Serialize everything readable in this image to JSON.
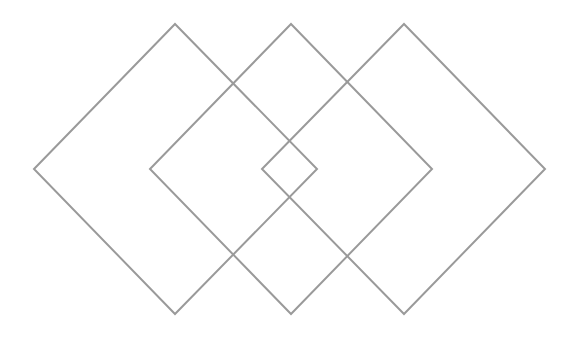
{
  "diagram": {
    "type": "overlapping-diamonds",
    "background": "#ffffff",
    "stroke_color": "#9a9a9a",
    "stroke_width": 2,
    "shapes": [
      {
        "name": "left-diamond",
        "points": [
          [
            34,
            169
          ],
          [
            175,
            24
          ],
          [
            317,
            169
          ],
          [
            175,
            314
          ]
        ]
      },
      {
        "name": "middle-diamond",
        "points": [
          [
            150,
            169
          ],
          [
            291,
            24
          ],
          [
            432,
            169
          ],
          [
            291,
            314
          ]
        ]
      },
      {
        "name": "right-diamond",
        "points": [
          [
            262,
            169
          ],
          [
            404,
            24
          ],
          [
            545,
            169
          ],
          [
            404,
            314
          ]
        ]
      }
    ]
  }
}
